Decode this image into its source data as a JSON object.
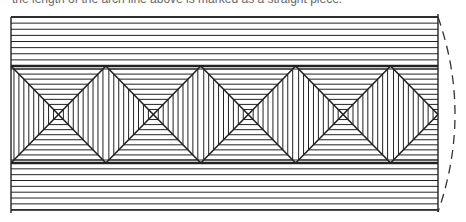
{
  "caption": "the length of the arch line above is marked as a straight piece.",
  "figure": {
    "full_cells": 4,
    "trailing_partial_cell": 0.5,
    "top_stripe_lines": 8,
    "bottom_stripe_lines": 8,
    "line_color": "#222222",
    "background_color": "#ffffff"
  }
}
